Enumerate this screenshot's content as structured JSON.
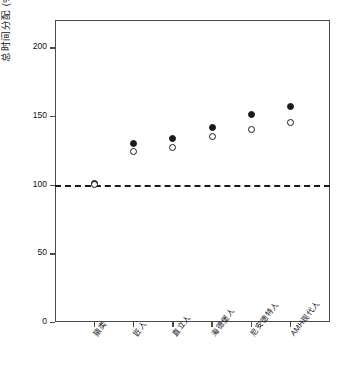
{
  "chart_data": {
    "type": "scatter",
    "title": "",
    "xlabel": "",
    "ylabel": "总时间分配 (%)",
    "ylim": [
      0,
      220
    ],
    "yticks": [
      0,
      50,
      100,
      150,
      200
    ],
    "ytick_labels": [
      "0",
      "50",
      "100",
      "150",
      "200"
    ],
    "grid": false,
    "legend_position": "none",
    "categories": [
      "猿类",
      "匠人",
      "直立人",
      "海德堡人",
      "尼安德特人",
      "AMH现代人"
    ],
    "reference_line": {
      "value": 100,
      "style": "dashed",
      "label": "100"
    },
    "series": [
      {
        "name": "filled-circle",
        "marker": "filled",
        "values": [
          101,
          130,
          134,
          142,
          151,
          157
        ]
      },
      {
        "name": "open-circle",
        "marker": "open",
        "values": [
          100,
          124,
          127,
          135,
          140,
          145
        ]
      }
    ]
  }
}
